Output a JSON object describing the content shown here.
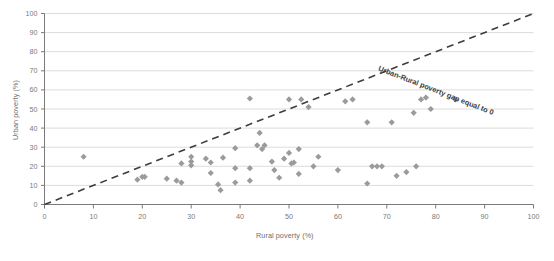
{
  "chart_data": {
    "type": "scatter",
    "title": "",
    "xlabel": "Rural poverty (%)",
    "ylabel": "Urban poverty (%)",
    "xlim": [
      0,
      100
    ],
    "ylim": [
      0,
      100
    ],
    "xticks": [
      0,
      10,
      20,
      30,
      40,
      50,
      60,
      70,
      80,
      90,
      100
    ],
    "yticks": [
      0,
      10,
      20,
      30,
      40,
      50,
      60,
      70,
      80,
      90,
      100
    ],
    "grid": "horizontal",
    "legend": "none",
    "marker": {
      "shape": "diamond",
      "color": "#9b9b9b",
      "size": 4
    },
    "series": [
      {
        "name": "Countries",
        "points": [
          [
            8,
            25
          ],
          [
            19,
            13
          ],
          [
            20,
            14.5
          ],
          [
            20.5,
            14.5
          ],
          [
            25,
            13.5
          ],
          [
            27,
            12.5
          ],
          [
            28,
            11.5
          ],
          [
            28,
            21.5
          ],
          [
            30,
            25
          ],
          [
            30,
            22.5
          ],
          [
            30,
            20.5
          ],
          [
            33,
            24
          ],
          [
            34,
            22
          ],
          [
            34,
            16.5
          ],
          [
            35.5,
            10.5
          ],
          [
            36,
            7.5
          ],
          [
            36.5,
            24.5
          ],
          [
            39,
            19
          ],
          [
            39,
            11.5
          ],
          [
            39,
            29.5
          ],
          [
            42,
            12.5
          ],
          [
            42,
            19
          ],
          [
            42,
            55.5
          ],
          [
            43.5,
            31
          ],
          [
            44,
            37.5
          ],
          [
            44.5,
            29
          ],
          [
            45,
            31
          ],
          [
            46.5,
            22.5
          ],
          [
            47,
            18
          ],
          [
            48,
            14
          ],
          [
            49,
            24
          ],
          [
            50,
            27
          ],
          [
            50,
            55
          ],
          [
            50.5,
            21.5
          ],
          [
            51,
            22
          ],
          [
            52,
            29
          ],
          [
            52,
            16
          ],
          [
            52.5,
            55
          ],
          [
            54,
            51
          ],
          [
            55,
            20
          ],
          [
            56,
            25
          ],
          [
            60,
            18
          ],
          [
            61.5,
            54
          ],
          [
            63,
            55
          ],
          [
            66,
            43
          ],
          [
            66,
            11
          ],
          [
            67,
            20
          ],
          [
            68,
            20
          ],
          [
            69,
            20
          ],
          [
            71,
            43
          ],
          [
            72,
            15
          ],
          [
            74,
            17
          ],
          [
            75.5,
            48
          ],
          [
            76,
            20
          ],
          [
            77,
            55
          ],
          [
            78,
            56
          ],
          [
            79,
            50
          ],
          [
            84,
            55
          ]
        ]
      }
    ],
    "reference_line": {
      "label": "Urban-Rural poverty gap equal to 0",
      "from": [
        0,
        0
      ],
      "to": [
        100,
        100
      ],
      "style": "dashed",
      "color": "#3d3d3d"
    }
  },
  "axes": {
    "y_title": "Urban poverty (%)",
    "x_title": "Rural poverty (%)",
    "y_tick_labels": [
      "0",
      "10",
      "20",
      "30",
      "40",
      "50",
      "60",
      "70",
      "80",
      "90",
      "100"
    ],
    "x_tick_labels": [
      "0",
      "10",
      "20",
      "30",
      "40",
      "50",
      "60",
      "70",
      "80",
      "90",
      "100"
    ]
  },
  "colors": {
    "marker": "#9b9b9b",
    "gridline": "#dcdcdc",
    "axis": "#7a7a7a",
    "annotation": "#3d3d3d",
    "background": "#ffffff"
  }
}
